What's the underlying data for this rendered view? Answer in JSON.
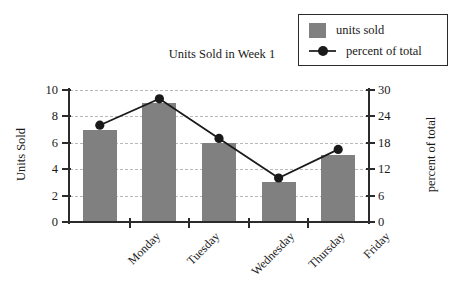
{
  "chart_data": {
    "type": "bar",
    "title": "Units Sold in Week 1",
    "categories": [
      "Monday",
      "Tuesday",
      "Wednesday",
      "Thursday",
      "Friday"
    ],
    "series": [
      {
        "name": "units sold",
        "type": "bar",
        "axis": "left",
        "values": [
          7,
          9,
          6,
          3,
          5.1
        ],
        "color": "#808080"
      },
      {
        "name": "percent of total",
        "type": "line",
        "axis": "right",
        "values": [
          22,
          28,
          19,
          10,
          16.5
        ],
        "color": "#1a1a1a"
      }
    ],
    "xlabel": "",
    "ylabel": "Units Sold",
    "y2label": "percent of total",
    "ylim": [
      0,
      10
    ],
    "y2lim": [
      0,
      30
    ],
    "yticks": [
      0,
      2,
      4,
      6,
      8,
      10
    ],
    "y2ticks": [
      0,
      6,
      12,
      18,
      24,
      30
    ],
    "grid": true,
    "legend_position": "top-right"
  },
  "legend": {
    "items": [
      {
        "label": "units sold"
      },
      {
        "label": "percent of total"
      }
    ]
  },
  "axes": {
    "left_title": "Units Sold",
    "right_title": "percent of total",
    "left_ticks": [
      "10",
      "8",
      "6",
      "4",
      "2",
      "0"
    ],
    "right_ticks": [
      "30",
      "24",
      "18",
      "12",
      "6",
      "0"
    ]
  }
}
